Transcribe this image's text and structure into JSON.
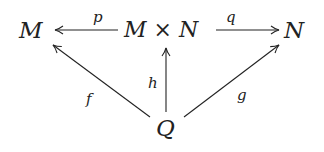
{
  "diagram": {
    "type": "commutative-diagram",
    "nodes": {
      "left": "M",
      "center": "M × N",
      "right": "N",
      "bottom": "Q"
    },
    "arrows": {
      "p": {
        "label": "p",
        "from": "M × N",
        "to": "M"
      },
      "q": {
        "label": "q",
        "from": "M × N",
        "to": "N"
      },
      "h": {
        "label": "h",
        "from": "Q",
        "to": "M × N"
      },
      "f": {
        "label": "f",
        "from": "Q",
        "to": "M"
      },
      "g": {
        "label": "g",
        "from": "Q",
        "to": "N"
      }
    },
    "colors": {
      "ink": "#222222",
      "background": "#ffffff"
    }
  }
}
